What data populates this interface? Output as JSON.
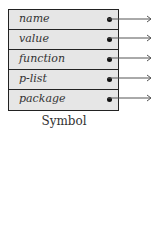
{
  "diagram": {
    "caption": "Symbol",
    "fields": [
      {
        "label": "name"
      },
      {
        "label": "value"
      },
      {
        "label": "function"
      },
      {
        "label": "p-list"
      },
      {
        "label": "package"
      }
    ],
    "colors": {
      "cell_fill": "#e6e6e6",
      "border": "#222222",
      "arrow": "#555555"
    }
  }
}
